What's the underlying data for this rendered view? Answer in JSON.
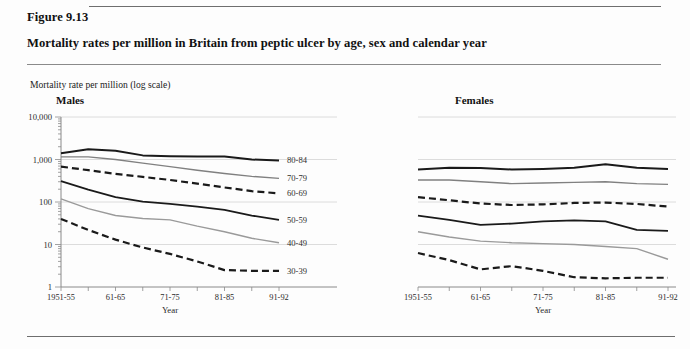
{
  "figure": {
    "number": "Figure 9.13",
    "title": "Mortality rates per million in Britain from peptic ulcer by age, sex and calendar year",
    "y_axis_caption": "Mortality rate per million (log scale)"
  },
  "panels": [
    {
      "key": "males",
      "heading": "Males"
    },
    {
      "key": "females",
      "heading": "Females"
    }
  ],
  "chart_data": {
    "type": "line",
    "title": "Mortality rates per million in Britain from peptic ulcer by age, sex and calendar year",
    "subtitle": "Figure 9.13",
    "xlabel": "Year",
    "ylabel": "Mortality rate per million (log scale)",
    "yscale": "log",
    "ylim": [
      1,
      10000
    ],
    "ytick_labels": [
      "10,000",
      "1,000",
      "100",
      "10",
      "1"
    ],
    "ytick_values": [
      10000,
      1000,
      100,
      10,
      1
    ],
    "grid": "horizontal",
    "legend": "right-of-series (direct labels)",
    "categories": [
      "1951-55",
      "56-60",
      "61-65",
      "66-70",
      "71-75",
      "76-80",
      "81-85",
      "86-90",
      "91-92"
    ],
    "xtick_labels": [
      "1951-55",
      "61-65",
      "71-75",
      "81-85",
      "91-92"
    ],
    "panels": [
      {
        "name": "Males",
        "series": [
          {
            "name": "80-84",
            "style": "solid",
            "color": "#1a1a1a",
            "width": 2.0,
            "values": [
              1400,
              1750,
              1600,
              1250,
              1200,
              1180,
              1180,
              1000,
              950
            ]
          },
          {
            "name": "70-79",
            "style": "solid",
            "color": "#808080",
            "width": 1.4,
            "values": [
              1150,
              1150,
              1000,
              820,
              680,
              560,
              470,
              400,
              360
            ]
          },
          {
            "name": "60-69",
            "style": "dashed",
            "color": "#1a1a1a",
            "width": 2.2,
            "values": [
              680,
              560,
              460,
              390,
              330,
              270,
              220,
              180,
              160
            ]
          },
          {
            "name": "50-59",
            "style": "solid",
            "color": "#1a1a1a",
            "width": 1.8,
            "values": [
              310,
              195,
              130,
              102,
              90,
              78,
              65,
              48,
              38
            ]
          },
          {
            "name": "40-49",
            "style": "solid",
            "color": "#9a9a9a",
            "width": 1.4,
            "values": [
              118,
              70,
              48,
              41,
              38,
              27,
              20,
              14,
              11
            ]
          },
          {
            "name": "30-39",
            "style": "dashed",
            "color": "#1a1a1a",
            "width": 2.2,
            "values": [
              40,
              22,
              13,
              8.5,
              6.0,
              4.0,
              2.5,
              2.4,
              2.4
            ]
          }
        ]
      },
      {
        "name": "Females",
        "series": [
          {
            "name": "80-84",
            "style": "solid",
            "color": "#1a1a1a",
            "width": 2.0,
            "values": [
              580,
              640,
              630,
              580,
              600,
              640,
              770,
              640,
              600
            ]
          },
          {
            "name": "70-79",
            "style": "solid",
            "color": "#808080",
            "width": 1.4,
            "values": [
              330,
              330,
              300,
              270,
              280,
              290,
              300,
              270,
              260
            ]
          },
          {
            "name": "60-69",
            "style": "dashed",
            "color": "#1a1a1a",
            "width": 2.2,
            "values": [
              130,
              110,
              92,
              85,
              88,
              95,
              97,
              90,
              78
            ]
          },
          {
            "name": "50-59",
            "style": "solid",
            "color": "#1a1a1a",
            "width": 1.8,
            "values": [
              48,
              38,
              29,
              31,
              35,
              37,
              35,
              22,
              21
            ]
          },
          {
            "name": "40-49",
            "style": "solid",
            "color": "#9a9a9a",
            "width": 1.4,
            "values": [
              20,
              15,
              12,
              11,
              10.5,
              10,
              9,
              8,
              4.5
            ]
          },
          {
            "name": "30-39",
            "style": "dashed",
            "color": "#1a1a1a",
            "width": 2.2,
            "values": [
              6.3,
              4.3,
              2.6,
              3.1,
              2.4,
              1.7,
              1.6,
              1.65,
              1.65
            ]
          }
        ]
      }
    ]
  }
}
